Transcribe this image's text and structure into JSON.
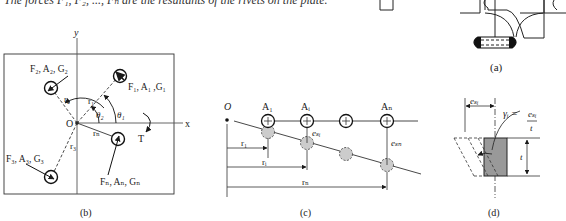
{
  "caption_text": "The forces F₁, F₂, ..., Fₙ are the resultants of the rivets on the plate.",
  "panels": {
    "a": {
      "label": "(a)"
    },
    "b": {
      "label": "(b)",
      "axis_x": "x",
      "axis_y": "y",
      "origin": "O",
      "torque": "T",
      "rivet1": "F₁, A₁ ,G₁",
      "rivet2": "F₂, A₂, G₂",
      "rivet3": "F₃, A₃, G₃",
      "rivetn": "Fₙ, Aₙ, Gₙ",
      "r1": "r₁",
      "r2": "r₂",
      "r3": "r₃",
      "rn": "rₙ",
      "theta1": "θ₁",
      "theta2": "θ₂"
    },
    "c": {
      "label": "(c)",
      "origin": "O",
      "A1": "A₁",
      "Ai": "Aᵢ",
      "An": "Aₙ",
      "e_si": "eₛᵢ",
      "e_sn": "eₛₙ",
      "r1": "r₁",
      "ri": "rᵢ",
      "rn": "rₙ"
    },
    "d": {
      "label": "(d)",
      "e_si": "eₛᵢ",
      "gamma_lhs": "γᵢ =",
      "gamma_num": "eₛᵢ",
      "gamma_den": "t",
      "thickness": "t"
    }
  }
}
